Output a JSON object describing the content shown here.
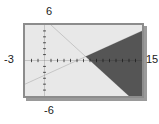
{
  "chart_data": {
    "type": "line",
    "title": "",
    "xlabel": "",
    "ylabel": "",
    "xlim": [
      -3,
      15
    ],
    "ylim": [
      -6,
      6
    ],
    "grid": false,
    "legend": null,
    "axis_labels": {
      "x_min": "-3",
      "x_max": "15",
      "y_min": "-6",
      "y_max": "6"
    },
    "tick_spacing": {
      "x": 1,
      "y": 1
    },
    "series": [
      {
        "name": "rising-line",
        "type": "line",
        "points": [
          [
            -3,
            -4
          ],
          [
            15,
            5
          ]
        ],
        "slope": 0.5,
        "intercept": -2.5,
        "color": "#3a3a3a"
      },
      {
        "name": "falling-line",
        "type": "line",
        "points": [
          [
            1,
            6
          ],
          [
            13,
            -6
          ]
        ],
        "slope": -1,
        "intercept": 7,
        "color": "#3a3a3a"
      }
    ],
    "intersection": [
      6.333,
      0.667
    ],
    "shaded_region": {
      "name": "solution-region",
      "description": "Wedge opening to the right, bounded above by the rising line and below by the falling line",
      "color": "#555555",
      "vertices": [
        [
          6.333,
          0.667
        ],
        [
          15,
          5
        ],
        [
          15,
          -6
        ],
        [
          13,
          -6
        ]
      ]
    },
    "colors": {
      "background": "#e8e8e8",
      "frame": "#8c8c8c",
      "axis": "#1a1a1a",
      "shading": "#555555",
      "label": "#1a1a1a"
    }
  }
}
